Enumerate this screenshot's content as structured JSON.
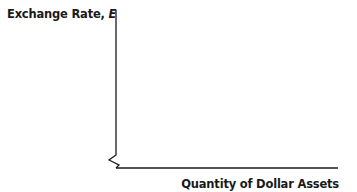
{
  "diagram": {
    "type": "axes-only economic graph",
    "y_axis_label": "Exchange Rate,",
    "y_axis_variable": "E",
    "x_axis_label": "Quantity of Dollar Assets",
    "axis_break": "zigzag break near origin on vertical axis",
    "curves": [],
    "line_color": "#1a1a1a"
  }
}
